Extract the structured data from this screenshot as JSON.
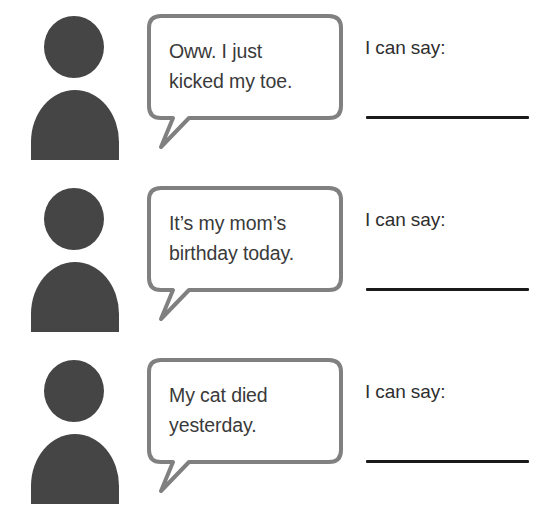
{
  "page": {
    "background_color": "#ffffff",
    "width": 546,
    "height": 517
  },
  "style": {
    "person_color": "#454545",
    "bubble_border_color": "#808080",
    "bubble_fill_color": "#ffffff",
    "bubble_text_color": "#3a3a3a",
    "prompt_text_color": "#2e2e2e",
    "answer_line_color": "#1a1a1a"
  },
  "rows": [
    {
      "speaker_icon": "person-silhouette-icon",
      "bubble_text": "Oww. I just\nkicked my toe.",
      "prompt_label": "I can say:",
      "answer_value": ""
    },
    {
      "speaker_icon": "person-silhouette-icon",
      "bubble_text": "It’s my mom’s\nbirthday today.",
      "prompt_label": "I can say:",
      "answer_value": ""
    },
    {
      "speaker_icon": "person-silhouette-icon",
      "bubble_text": "My cat died\nyesterday.",
      "prompt_label": "I can say:",
      "answer_value": ""
    }
  ]
}
